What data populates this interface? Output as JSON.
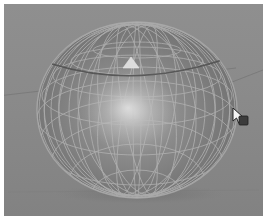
{
  "app": {
    "view_type": "3d-viewport",
    "title": "3D Viewport",
    "shading_mode": "Solid",
    "projection": "Perspective"
  },
  "viewport": {
    "background_color": "#8b8b8b",
    "floor_grid_color": "#7c7c7c",
    "frame_border_color": "#ffffff",
    "horizon_line_color": "#6f6f6f"
  },
  "object": {
    "name": "Sphere",
    "type": "uv-sphere",
    "display_mode": "wireframe-on-shaded",
    "surface_color": "#7d7d7d",
    "wireframe_color": "#b4b4b4",
    "outline_color": "#adadad",
    "specular_highlight_color": "#d8d8d8",
    "segments": 24,
    "rings": 12,
    "center_x": 133,
    "center_y": 106,
    "radius_x": 100,
    "radius_y": 88
  },
  "selection": {
    "marker_type": "face-triangle",
    "marker_color": "#d9d9d9",
    "marker_x": 127,
    "marker_y": 58,
    "active_edge_color": "#4a4a4a"
  },
  "cursor": {
    "type": "arrow-pointer",
    "x": 232,
    "y": 106,
    "fill_color": "#f2f2f2",
    "outline_color": "#2b2b2b",
    "badge_color": "#3a3a3a"
  },
  "annotations": {
    "ground_lines": "two perspective ground lines converging behind the sphere",
    "bottom_line": "faint horizontal floor edge near the lower frame"
  }
}
